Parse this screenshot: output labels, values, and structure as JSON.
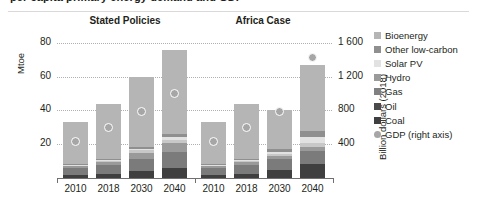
{
  "figure": {
    "title_partial": "per capita primary energy demand and GDP",
    "left_axis_label": "Mtoe",
    "right_axis_label": "Billion dollars (2018)"
  },
  "chart_data": {
    "type": "bar",
    "title": "per capita primary energy demand and GDP",
    "xlabel": "",
    "ylabel": "Mtoe",
    "y2label": "Billion dollars (2018)",
    "ylim": [
      0,
      90
    ],
    "y2lim": [
      0,
      1800
    ],
    "yticks": [
      "20",
      "40",
      "60",
      "80"
    ],
    "ytick_values": [
      20,
      40,
      60,
      80
    ],
    "y2ticks": [
      "400",
      "800",
      "1 200",
      "1 600"
    ],
    "y2tick_values": [
      400,
      800,
      1200,
      1600
    ],
    "grid": "horizontal-dotted",
    "legend_position": "right",
    "groups": [
      {
        "name": "Stated Policies",
        "categories": [
          "2010",
          "2018",
          "2030",
          "2040"
        ]
      },
      {
        "name": "Africa Case",
        "categories": [
          "2010",
          "2018",
          "2030",
          "2040"
        ]
      }
    ],
    "categories": [
      "2010",
      "2018",
      "2030",
      "2040",
      "2010",
      "2018",
      "2030",
      "2040"
    ],
    "series": [
      {
        "name": "Coal",
        "color": "#3f3f3f",
        "values": [
          2.0,
          2.5,
          4.0,
          6.0,
          2.0,
          2.5,
          4.5,
          8.5
        ]
      },
      {
        "name": "Oil",
        "color": "#7b7b7b",
        "values": [
          4.0,
          5.5,
          7.5,
          9.5,
          4.0,
          5.5,
          6.5,
          7.5
        ]
      },
      {
        "name": "Gas",
        "color": "#9a9a9a",
        "values": [
          1.0,
          1.5,
          3.5,
          5.0,
          1.0,
          1.5,
          2.0,
          2.5
        ]
      },
      {
        "name": "Hydro",
        "color": "#c8c8c8",
        "values": [
          0.8,
          1.0,
          1.5,
          2.0,
          0.8,
          1.0,
          1.5,
          2.5
        ]
      },
      {
        "name": "Solar PV",
        "color": "#e2e2e2",
        "values": [
          0.2,
          0.3,
          0.8,
          1.5,
          0.2,
          0.3,
          1.0,
          3.0
        ]
      },
      {
        "name": "Other low-carbon",
        "color": "#8f8f8f",
        "values": [
          0.5,
          0.7,
          1.2,
          2.0,
          0.5,
          0.7,
          1.5,
          4.0
        ]
      },
      {
        "name": "Bioenergy",
        "color": "#b5b5b5",
        "values": [
          24.5,
          32.5,
          41.5,
          50.0,
          24.5,
          32.5,
          23.0,
          39.0
        ]
      }
    ],
    "totals": [
      33,
      44,
      60,
      76,
      33,
      44,
      40,
      67
    ],
    "gdp_series": {
      "name": "GDP (right axis)",
      "color": "#a6a6a6",
      "axis": "right",
      "marker": "circle",
      "values": [
        430,
        600,
        790,
        1000,
        430,
        600,
        790,
        1430
      ]
    },
    "legend": [
      {
        "label": "Bioenergy",
        "color": "#b5b5b5",
        "marker": "square"
      },
      {
        "label": "Other low-carbon",
        "color": "#8f8f8f",
        "marker": "square"
      },
      {
        "label": "Solar PV",
        "color": "#e2e2e2",
        "marker": "square"
      },
      {
        "label": "Hydro",
        "color": "#9a9a9a",
        "marker": "square"
      },
      {
        "label": "Gas",
        "color": "#808080",
        "marker": "square"
      },
      {
        "label": "Oil",
        "color": "#4a4a4a",
        "marker": "square"
      },
      {
        "label": "Coal",
        "color": "#3f3f3f",
        "marker": "square"
      },
      {
        "label": "GDP (right axis)",
        "color": "#a6a6a6",
        "marker": "circle"
      }
    ]
  }
}
